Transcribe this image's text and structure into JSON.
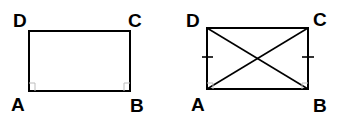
{
  "figures": [
    {
      "id": "rectangle",
      "description": "Rectangle ABCD",
      "vertices": {
        "D": {
          "label": "D",
          "x": 29,
          "y": 31
        },
        "C": {
          "label": "C",
          "x": 130,
          "y": 31
        },
        "A": {
          "label": "A",
          "x": 29,
          "y": 91
        },
        "B": {
          "label": "B",
          "x": 130,
          "y": 91
        }
      },
      "right_angle_marks": [
        "A",
        "B"
      ],
      "diagonals": false,
      "equal_side_marks": []
    },
    {
      "id": "rectangle-with-diagonals",
      "description": "Rectangle ABCD with diagonals AC and BD; sides AD and BC marked equal",
      "vertices": {
        "D": {
          "label": "D",
          "x": 207,
          "y": 28
        },
        "C": {
          "label": "C",
          "x": 308,
          "y": 28
        },
        "A": {
          "label": "A",
          "x": 207,
          "y": 89
        },
        "B": {
          "label": "B",
          "x": 308,
          "y": 89
        }
      },
      "right_angle_marks": [
        "A",
        "B"
      ],
      "diagonals": [
        "AC",
        "BD"
      ],
      "equal_side_marks": [
        "AD",
        "BC"
      ]
    }
  ],
  "colors": {
    "stroke": "#000000",
    "right_angle_mark": "#bdbdbd",
    "background": "#ffffff"
  }
}
